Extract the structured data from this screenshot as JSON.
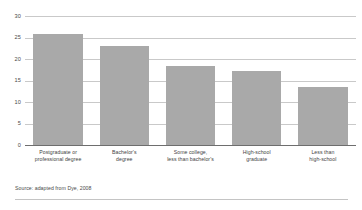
{
  "chart_data": {
    "type": "bar",
    "title": "",
    "subtitle": "",
    "xlabel": "",
    "ylabel": "",
    "categories": [
      "Postgraduate or\nprofessional degree",
      "Bachelor's\ndegree",
      "Some college,\nless than bachelor's",
      "High-school\ngraduate",
      "Less than\nhigh-school"
    ],
    "category_lines": [
      [
        "Postgraduate or",
        "professional degree"
      ],
      [
        "Bachelor's",
        "degree"
      ],
      [
        "Some college,",
        "less than bachelor's"
      ],
      [
        "High-school",
        "graduate"
      ],
      [
        "Less than",
        "high-school"
      ]
    ],
    "values": [
      25.8,
      23.0,
      18.3,
      17.2,
      13.6
    ],
    "ylim": [
      0,
      30
    ],
    "yticks": [
      0,
      5,
      10,
      15,
      20,
      25,
      30
    ],
    "ytick_labels": [
      "0",
      "5",
      "10",
      "15",
      "20",
      "25",
      "30"
    ],
    "grid": true,
    "grid_axis": "y",
    "legend": null,
    "bar_color": "#a9a9a9",
    "gridline_color": "#c9c9c9",
    "axis_color": "#6e6e6e"
  },
  "source_note": "Source: adapted from Dye, 2008"
}
